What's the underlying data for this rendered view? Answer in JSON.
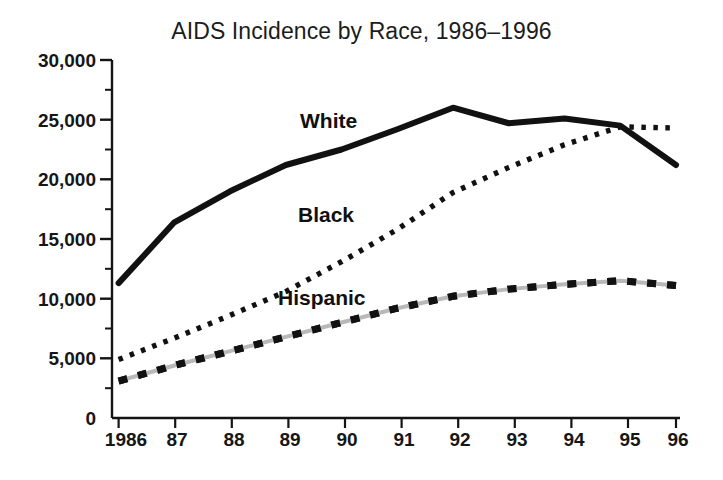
{
  "figure": {
    "background_color": "#ffffff",
    "ink_color": "#111111"
  },
  "chart_data": {
    "type": "line",
    "title": "AIDS Incidence by Race, 1986–1996",
    "xlabel": "",
    "ylabel": "",
    "x": [
      1986,
      1987,
      1988,
      1989,
      1990,
      1991,
      1992,
      1993,
      1994,
      1995,
      1996
    ],
    "categories": [
      "1986",
      "87",
      "88",
      "89",
      "90",
      "91",
      "92",
      "93",
      "94",
      "95",
      "96"
    ],
    "xtick_labels": [
      "1986",
      "87",
      "88",
      "89",
      "90",
      "91",
      "92",
      "93",
      "94",
      "95",
      "96"
    ],
    "ytick_labels": [
      "0",
      "5,000",
      "10,000",
      "15,000",
      "20,000",
      "25,000",
      "30,000"
    ],
    "ytick_values": [
      0,
      5000,
      10000,
      15000,
      20000,
      25000,
      30000
    ],
    "minor_ytick_values": [
      2500,
      7500,
      12500,
      17500,
      22500,
      27500
    ],
    "ylim": [
      0,
      30000
    ],
    "xlim": [
      1986,
      1996
    ],
    "grid": false,
    "legend_position": "inline-labels",
    "series": [
      {
        "name": "White",
        "style": "solid",
        "color": "#111111",
        "label_text": "White",
        "values": [
          11300,
          16400,
          19000,
          21200,
          22500,
          24200,
          26000,
          24700,
          25100,
          24500,
          21200
        ]
      },
      {
        "name": "Black",
        "style": "dotted",
        "color": "#111111",
        "label_text": "Black",
        "values": [
          4900,
          6700,
          8600,
          10600,
          13100,
          15800,
          18900,
          21000,
          22900,
          24400,
          24300
        ]
      },
      {
        "name": "Hispanic",
        "style": "dashed",
        "color": "#111111",
        "label_text": "Hispanic",
        "values": [
          3100,
          4400,
          5600,
          6800,
          8000,
          9200,
          10200,
          10800,
          11200,
          11500,
          11100
        ]
      }
    ]
  }
}
